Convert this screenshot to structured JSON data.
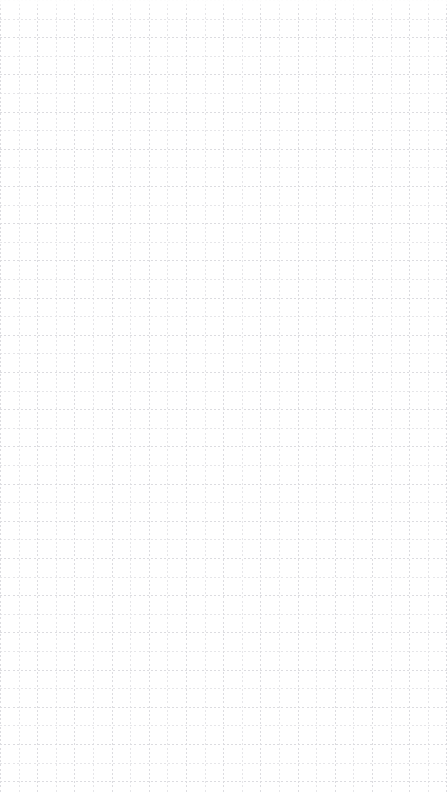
{
  "canvas": {
    "name": "grid-canvas",
    "width": 448,
    "height": 793,
    "background_color": "#ffffff",
    "is_empty": true,
    "content_items": [],
    "grid": {
      "visible": true,
      "style": "dashed",
      "minor_spacing_px": 18.6,
      "major_spacing_px": 37.2,
      "minor_color": "#e6e6e9",
      "major_color": "#dcdce0",
      "dash_length_px": 2,
      "dash_gap_px": 2.2,
      "line_width_px": 1
    }
  }
}
